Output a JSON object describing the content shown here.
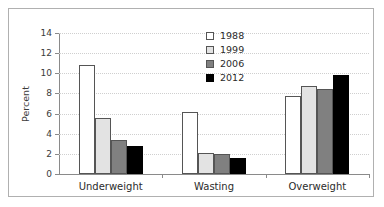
{
  "chart_data": {
    "type": "bar",
    "title": "",
    "subtitle": "",
    "xlabel": "",
    "ylabel": "Percent",
    "categories": [
      "Underweight",
      "Wasting",
      "Overweight"
    ],
    "series": [
      {
        "name": "1988",
        "color": "#ffffff",
        "values": [
          10.8,
          6.2,
          7.75
        ]
      },
      {
        "name": "1999",
        "color": "#e3e3e3",
        "values": [
          5.55,
          2.1,
          8.75
        ]
      },
      {
        "name": "2006",
        "color": "#808080",
        "values": [
          3.4,
          2.0,
          8.4
        ]
      },
      {
        "name": "2012",
        "color": "#000000",
        "values": [
          2.8,
          1.6,
          9.8
        ]
      }
    ],
    "ylim": [
      0,
      14
    ],
    "yticks": [
      0,
      2,
      4,
      6,
      8,
      10,
      12,
      14
    ],
    "ytick_labels": [
      "0",
      "2",
      "4",
      "6",
      "8",
      "10",
      "12",
      "14"
    ],
    "grid": "horizontal-dotted",
    "legend_position": "top-center-right",
    "legend_entries": [
      "1988",
      "1999",
      "2006",
      "2012"
    ]
  },
  "style": {
    "frame_color": "#b0b0b0",
    "axis_color": "#8a8a8a",
    "grid_color": "#cfcfcf",
    "bar_edge_color": "#555555",
    "text_color": "#2b2b2b"
  }
}
